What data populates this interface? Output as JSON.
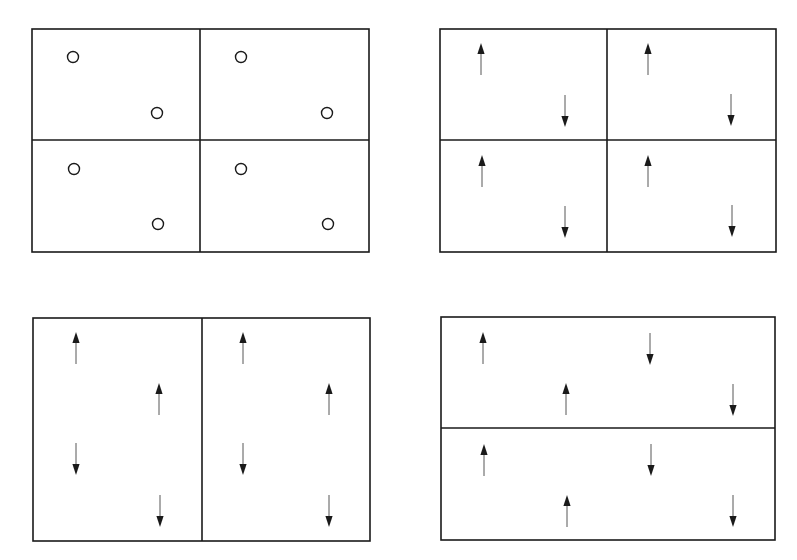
{
  "diagram": {
    "background": "#ffffff",
    "stroke_color": "#1a1a1a",
    "panels": [
      {
        "id": "panel-a",
        "description": "2x2 cells, each containing two circles (unmarked sites)",
        "box": {
          "x": 32,
          "y": 29,
          "w": 337,
          "h": 223
        },
        "dividers": [
          {
            "x1": 200,
            "y1": 29,
            "x2": 200,
            "y2": 252
          },
          {
            "x1": 32,
            "y1": 140,
            "x2": 369,
            "y2": 140
          }
        ],
        "circles": [
          {
            "cx": 73,
            "cy": 57
          },
          {
            "cx": 157,
            "cy": 113
          },
          {
            "cx": 241,
            "cy": 57
          },
          {
            "cx": 327,
            "cy": 113
          },
          {
            "cx": 74,
            "cy": 169
          },
          {
            "cx": 158,
            "cy": 224
          },
          {
            "cx": 241,
            "cy": 169
          },
          {
            "cx": 328,
            "cy": 224
          }
        ],
        "arrows": []
      },
      {
        "id": "panel-b",
        "description": "2x2 cells, each with an up arrow top-left and a down arrow bottom-right",
        "box": {
          "x": 440,
          "y": 29,
          "w": 336,
          "h": 223
        },
        "dividers": [
          {
            "x1": 607,
            "y1": 29,
            "x2": 607,
            "y2": 252
          },
          {
            "x1": 440,
            "y1": 140,
            "x2": 776,
            "y2": 140
          }
        ],
        "circles": [],
        "arrows": [
          {
            "x": 481,
            "y_tail": 75,
            "y_head": 43,
            "dir": "up"
          },
          {
            "x": 565,
            "y_tail": 95,
            "y_head": 127,
            "dir": "down"
          },
          {
            "x": 648,
            "y_tail": 75,
            "y_head": 43,
            "dir": "up"
          },
          {
            "x": 731,
            "y_tail": 94,
            "y_head": 126,
            "dir": "down"
          },
          {
            "x": 482,
            "y_tail": 187,
            "y_head": 155,
            "dir": "up"
          },
          {
            "x": 565,
            "y_tail": 206,
            "y_head": 238,
            "dir": "down"
          },
          {
            "x": 648,
            "y_tail": 187,
            "y_head": 155,
            "dir": "up"
          },
          {
            "x": 732,
            "y_tail": 205,
            "y_head": 237,
            "dir": "down"
          }
        ]
      },
      {
        "id": "panel-c",
        "description": "2 tall cells side by side, each with four arrows (up, up, down, down)",
        "box": {
          "x": 33,
          "y": 318,
          "w": 337,
          "h": 223
        },
        "dividers": [
          {
            "x1": 202,
            "y1": 318,
            "x2": 202,
            "y2": 541
          }
        ],
        "circles": [],
        "arrows": [
          {
            "x": 76,
            "y_tail": 364,
            "y_head": 332,
            "dir": "up"
          },
          {
            "x": 159,
            "y_tail": 415,
            "y_head": 383,
            "dir": "up"
          },
          {
            "x": 76,
            "y_tail": 443,
            "y_head": 475,
            "dir": "down"
          },
          {
            "x": 160,
            "y_tail": 495,
            "y_head": 527,
            "dir": "down"
          },
          {
            "x": 243,
            "y_tail": 364,
            "y_head": 332,
            "dir": "up"
          },
          {
            "x": 329,
            "y_tail": 415,
            "y_head": 383,
            "dir": "up"
          },
          {
            "x": 243,
            "y_tail": 443,
            "y_head": 475,
            "dir": "down"
          },
          {
            "x": 329,
            "y_tail": 495,
            "y_head": 527,
            "dir": "down"
          }
        ]
      },
      {
        "id": "panel-d",
        "description": "2 wide cells stacked, each with four arrows (up, down, up, down)",
        "box": {
          "x": 441,
          "y": 317,
          "w": 334,
          "h": 223
        },
        "dividers": [
          {
            "x1": 441,
            "y1": 428,
            "x2": 775,
            "y2": 428
          }
        ],
        "circles": [],
        "arrows": [
          {
            "x": 483,
            "y_tail": 364,
            "y_head": 332,
            "dir": "up"
          },
          {
            "x": 650,
            "y_tail": 333,
            "y_head": 365,
            "dir": "down"
          },
          {
            "x": 566,
            "y_tail": 415,
            "y_head": 383,
            "dir": "up"
          },
          {
            "x": 733,
            "y_tail": 384,
            "y_head": 416,
            "dir": "down"
          },
          {
            "x": 484,
            "y_tail": 476,
            "y_head": 444,
            "dir": "up"
          },
          {
            "x": 651,
            "y_tail": 444,
            "y_head": 476,
            "dir": "down"
          },
          {
            "x": 567,
            "y_tail": 527,
            "y_head": 495,
            "dir": "up"
          },
          {
            "x": 733,
            "y_tail": 495,
            "y_head": 527,
            "dir": "down"
          }
        ]
      }
    ]
  }
}
